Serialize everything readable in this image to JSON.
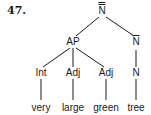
{
  "example_number": "47.",
  "nodes": {
    "root": {
      "label": "N",
      "bars": 2
    },
    "ap": {
      "label": "AP"
    },
    "nbar": {
      "label": "N",
      "bars": 1
    },
    "int": {
      "label": "Int"
    },
    "adj1": {
      "label": "Adj"
    },
    "adj2": {
      "label": "Adj"
    },
    "n": {
      "label": "N"
    }
  },
  "words": [
    "very",
    "large",
    "green",
    "tree"
  ],
  "edges": [
    [
      "root",
      "ap"
    ],
    [
      "root",
      "nbar"
    ],
    [
      "ap",
      "int"
    ],
    [
      "ap",
      "adj1"
    ],
    [
      "ap",
      "adj2"
    ],
    [
      "nbar",
      "n"
    ],
    [
      "int",
      "very"
    ],
    [
      "adj1",
      "large"
    ],
    [
      "adj2",
      "green"
    ],
    [
      "n",
      "tree"
    ]
  ],
  "colors": {
    "ink": "#1a1a1a",
    "background": "#ffffff"
  }
}
